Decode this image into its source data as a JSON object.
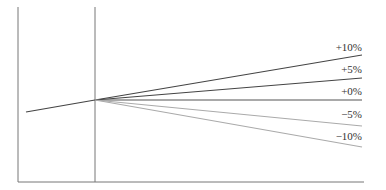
{
  "chart_data": {
    "type": "line",
    "title": "",
    "xlabel": "",
    "ylabel": "",
    "grid": false,
    "legend_position": "none",
    "annotations": [
      "+10%",
      "+5%",
      "+0%",
      "−5%",
      "−10%"
    ],
    "history": {
      "name": "history",
      "start": [
        26,
        112
      ],
      "end": [
        95,
        100
      ],
      "color": "#444444"
    },
    "divider_x": 95,
    "series": [
      {
        "name": "+10%",
        "label": "+10%",
        "end_y": 55,
        "label_y": 54,
        "color": "#444444"
      },
      {
        "name": "+5%",
        "label": "+5%",
        "end_y": 78,
        "label_y": 76,
        "color": "#444444"
      },
      {
        "name": "+0%",
        "label": "+0%",
        "end_y": 100,
        "label_y": 98,
        "color": "#555555"
      },
      {
        "name": "-5%",
        "label": "−5%",
        "end_y": 126,
        "label_y": 121,
        "color": "#aaaaaa"
      },
      {
        "name": "-10%",
        "label": "−10%",
        "end_y": 147,
        "label_y": 143,
        "color": "#aaaaaa"
      }
    ]
  },
  "axes": {
    "left_x": 18,
    "top_y": 7,
    "bottom_y": 182,
    "right_x": 364
  }
}
